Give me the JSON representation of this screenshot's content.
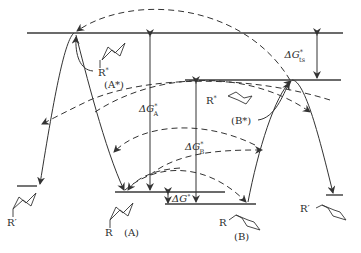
{
  "diagram": {
    "type": "energy-level diagram",
    "levels": [
      {
        "id": "A-star",
        "label": "R*",
        "state": "(A*)"
      },
      {
        "id": "B-star",
        "label": "R*",
        "state": "(B*)"
      },
      {
        "id": "A",
        "label": "R",
        "state": "(A)"
      },
      {
        "id": "B",
        "label": "R",
        "state": "(B)"
      },
      {
        "id": "product-left",
        "label": "R′"
      },
      {
        "id": "product-right",
        "label": "R′"
      }
    ],
    "energy_gaps": {
      "dG_A": {
        "main": "ΔG",
        "sup": "*",
        "sub": "A"
      },
      "dG_B": {
        "main": "ΔG",
        "sup": "*",
        "sub": "B"
      },
      "dG_ts": {
        "main": "ΔG",
        "sup": "*",
        "sub": "ts"
      },
      "dG_0": {
        "main": "ΔG",
        "sup": "°"
      }
    },
    "labels": {
      "a_star_r": "R",
      "a_star_sup": "*",
      "a_star_state": "(A*)",
      "b_star_r": "R",
      "b_star_sup": "*",
      "b_star_state": "(B*)",
      "a_r": "R",
      "a_state": "(A)",
      "b_r": "R",
      "b_state": "(B)",
      "left_product": "R′",
      "right_product": "R′"
    }
  }
}
